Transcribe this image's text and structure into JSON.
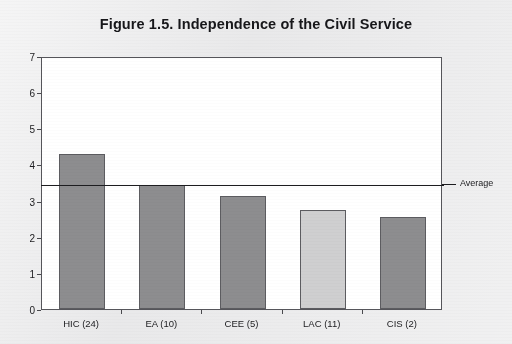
{
  "title": "Figure 1.5.  Independence of the Civil Service",
  "average_label": "Average",
  "colors": {
    "page_background": "#e9e9ea",
    "plot_background": "#ffffff",
    "bar_dark": "#8d8d8f",
    "bar_light": "#cfcfd0",
    "bar_border": "#5c5c60",
    "axis": "#55555a",
    "text": "#1c1c1f",
    "average_line": "#1d1d20"
  },
  "chart_data": {
    "type": "bar",
    "title": "Figure 1.5.  Independence of the Civil Service",
    "xlabel": "",
    "ylabel": "",
    "ylim": [
      0,
      7
    ],
    "yticks": [
      "0",
      "1",
      "2",
      "3",
      "4",
      "5",
      "6",
      "7"
    ],
    "grid": false,
    "legend": false,
    "categories": [
      "HIC (24)",
      "EA (10)",
      "CEE (5)",
      "LAC (11)",
      "CIS (2)"
    ],
    "values": [
      4.3,
      3.43,
      3.13,
      2.73,
      2.55
    ],
    "bar_colors": [
      "#8d8d8f",
      "#8d8d8f",
      "#8d8d8f",
      "#cfcfd0",
      "#8d8d8f"
    ],
    "annotations": [
      {
        "name": "average-line",
        "type": "hline",
        "value": 3.5,
        "label": "Average"
      }
    ]
  }
}
